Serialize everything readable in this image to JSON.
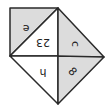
{
  "diagram": {
    "title": "",
    "colors": {
      "background": "#ffffff",
      "shaded": "#dcdcdc",
      "unshaded": "#ffffff",
      "stroke": "#2a2a2a",
      "label": "#222222"
    },
    "regions": [
      {
        "id": "top-left",
        "label": "e",
        "shaded": true,
        "rotation": 180
      },
      {
        "id": "center",
        "label": "23",
        "shaded": false,
        "rotation": 180
      },
      {
        "id": "right",
        "label": "c",
        "shaded": true,
        "rotation": 90
      },
      {
        "id": "bottom-left",
        "label": "h",
        "label_note": "glyph uncertain; reading at 3x zoom could also be 4",
        "shaded": false,
        "rotation": 180
      },
      {
        "id": "bottom-right",
        "label": "8",
        "shaded": true,
        "rotation": 45
      }
    ]
  }
}
